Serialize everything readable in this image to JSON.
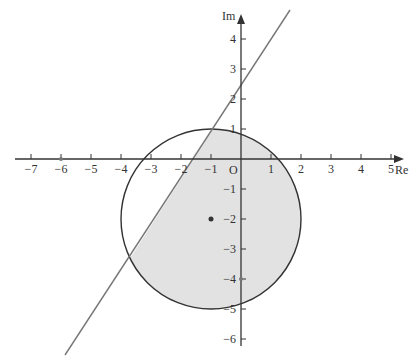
{
  "chart_data": {
    "type": "diagram",
    "title": "",
    "axes": {
      "x_label": "Re",
      "y_label": "Im",
      "origin_label": "O",
      "x_ticks": [
        -7,
        -6,
        -5,
        -4,
        -3,
        -2,
        -1,
        1,
        2,
        3,
        4,
        5
      ],
      "y_ticks": [
        4,
        3,
        2,
        1,
        -1,
        -2,
        -3,
        -4,
        -5,
        -6
      ],
      "x_range": [
        -7.5,
        5.5
      ],
      "y_range": [
        -6.5,
        5
      ]
    },
    "circle": {
      "center": [
        -1,
        -2
      ],
      "radius": 3
    },
    "center_point": [
      -1,
      -2
    ],
    "line": {
      "equation": "y = 1.5x + 2.5",
      "y_intercept": 2.5,
      "slope": 1.5
    },
    "marked_points": [
      [
        -6,
        0
      ],
      [
        0,
        -4
      ]
    ],
    "shaded_region": "inside circle and to the right of / below the line"
  },
  "labels": {
    "x_axis": "Re",
    "y_axis": "Im",
    "origin": "O",
    "x_ticks": [
      "−7",
      "−6",
      "−5",
      "−4",
      "−3",
      "−2",
      "−1",
      "1",
      "2",
      "3",
      "4",
      "5"
    ],
    "y_ticks": [
      "4",
      "3",
      "2",
      "1",
      "−1",
      "−2",
      "−3",
      "−4",
      "−5",
      "−6"
    ]
  }
}
